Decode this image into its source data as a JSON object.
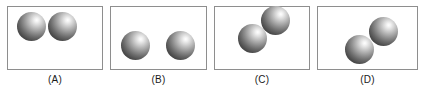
{
  "figure": {
    "title": "",
    "background_color": "#ffffff",
    "width": 427,
    "height": 94,
    "panel_border_color": "#8e8e8e",
    "sphere_highlight_color": "#ffffff",
    "sphere_shadow_color": "#333333",
    "label_color": "#1a1a1a"
  },
  "panels": [
    {
      "label": "(A)",
      "frame": {
        "x": 7,
        "y": 6,
        "width": 96,
        "height": 64
      },
      "label_pos": {
        "x": 7,
        "y": 74,
        "width": 96
      },
      "spheres": [
        {
          "cx": 31,
          "cy": 26,
          "d": 29
        },
        {
          "cx": 62,
          "cy": 26,
          "d": 29
        }
      ]
    },
    {
      "label": "(B)",
      "frame": {
        "x": 110,
        "y": 6,
        "width": 97,
        "height": 64
      },
      "label_pos": {
        "x": 110,
        "y": 74,
        "width": 97
      },
      "spheres": [
        {
          "cx": 135,
          "cy": 45,
          "d": 29
        },
        {
          "cx": 180,
          "cy": 45,
          "d": 29
        }
      ]
    },
    {
      "label": "(C)",
      "frame": {
        "x": 214,
        "y": 6,
        "width": 96,
        "height": 64
      },
      "label_pos": {
        "x": 214,
        "y": 74,
        "width": 96
      },
      "spheres": [
        {
          "cx": 252,
          "cy": 38,
          "d": 29
        },
        {
          "cx": 275,
          "cy": 20,
          "d": 29
        }
      ]
    },
    {
      "label": "(D)",
      "frame": {
        "x": 317,
        "y": 6,
        "width": 101,
        "height": 64
      },
      "label_pos": {
        "x": 317,
        "y": 74,
        "width": 101
      },
      "spheres": [
        {
          "cx": 359,
          "cy": 49,
          "d": 29
        },
        {
          "cx": 383,
          "cy": 31,
          "d": 29
        }
      ]
    }
  ]
}
